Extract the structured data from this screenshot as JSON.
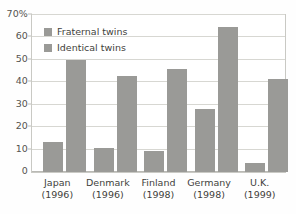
{
  "chart_data": {
    "type": "bar",
    "title": "",
    "subtitle": "",
    "xlabel": "",
    "ylabel": "",
    "ylim": [
      0,
      70
    ],
    "grid": true,
    "legend_position": "top-left-inside",
    "categories": [
      "Japan",
      "Denmark",
      "Finland",
      "Germany",
      "U.K."
    ],
    "category_years": [
      "(1996)",
      "(1996)",
      "(1998)",
      "(1998)",
      "(1999)"
    ],
    "category_labels": [
      "Japan (1996)",
      "Denmark (1996)",
      "Finland (1998)",
      "Germany (1998)",
      "U.K. (1999)"
    ],
    "series": [
      {
        "name": "Fraternal twins",
        "values": [
          13.5,
          10.5,
          9.5,
          28,
          4
        ]
      },
      {
        "name": "Identical twins",
        "values": [
          50,
          43,
          46,
          64.5,
          41.5
        ]
      }
    ],
    "y_ticks": [
      0,
      10,
      20,
      30,
      40,
      50,
      60,
      70
    ],
    "y_tick_labels": [
      "0",
      "10",
      "20",
      "30",
      "40",
      "50",
      "60",
      "70%"
    ],
    "colors": {
      "bar": "#9a9a97",
      "gridline": "#d7d7d2",
      "frame": "#c9c9c4",
      "text": "#3f3f3c",
      "background": "#ffffff"
    }
  },
  "legend": {
    "items": [
      {
        "label": "Fraternal twins",
        "swatch_name": "legend-swatch-fraternal"
      },
      {
        "label": "Identical twins",
        "swatch_name": "legend-swatch-identical"
      }
    ]
  }
}
